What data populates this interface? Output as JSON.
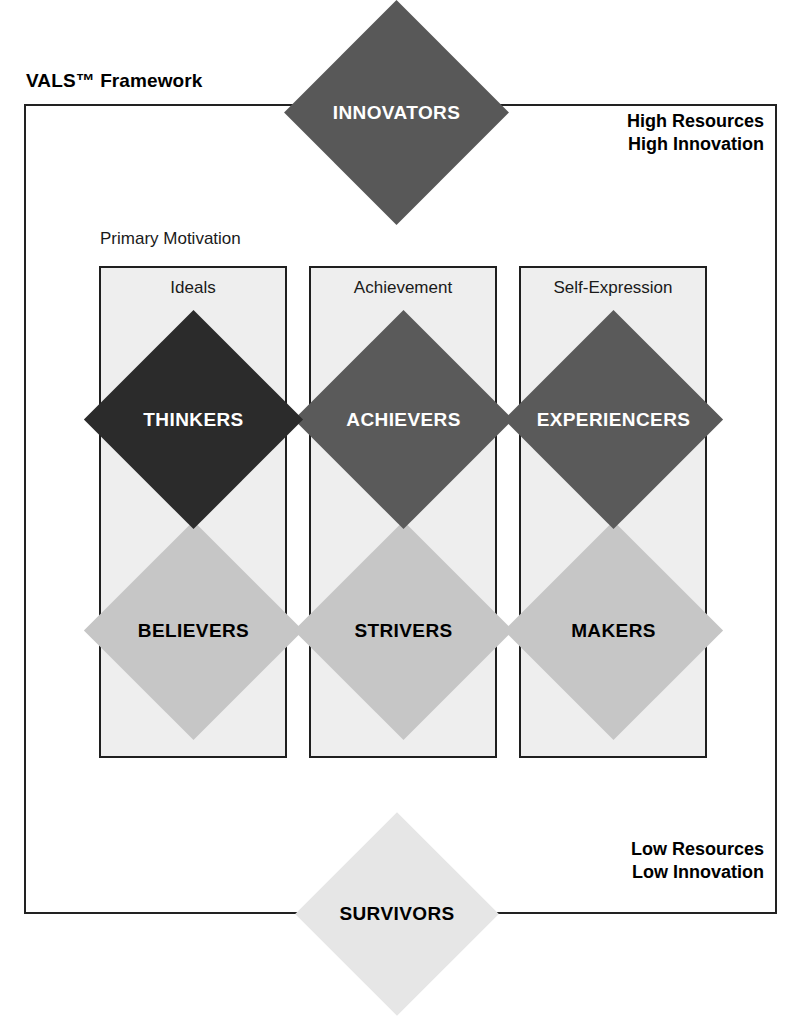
{
  "diagram": {
    "title": "VALS™ Framework",
    "primary_motivation_label": "Primary Motivation",
    "top_corner": {
      "line1": "High Resources",
      "line2": "High Innovation"
    },
    "bottom_corner": {
      "line1": "Low Resources",
      "line2": "Low Innovation"
    },
    "columns": [
      {
        "header": "Ideals"
      },
      {
        "header": "Achievement"
      },
      {
        "header": "Self-Expression"
      }
    ],
    "segments": {
      "innovators": {
        "label": "INNOVATORS",
        "fill": "#585858",
        "text_color": "#ffffff"
      },
      "thinkers": {
        "label": "THINKERS",
        "fill": "#2b2b2b",
        "text_color": "#ffffff"
      },
      "achievers": {
        "label": "ACHIEVERS",
        "fill": "#5a5a5a",
        "text_color": "#ffffff"
      },
      "experiencers": {
        "label": "EXPERIENCERS",
        "fill": "#5a5a5a",
        "text_color": "#ffffff"
      },
      "believers": {
        "label": "BELIEVERS",
        "fill": "#c6c6c6",
        "text_color": "#000000"
      },
      "strivers": {
        "label": "STRIVERS",
        "fill": "#c6c6c6",
        "text_color": "#000000"
      },
      "makers": {
        "label": "MAKERS",
        "fill": "#c6c6c6",
        "text_color": "#000000"
      },
      "survivors": {
        "label": "SURVIVORS",
        "fill": "#e6e6e6",
        "text_color": "#000000"
      }
    }
  },
  "chart_data": {
    "type": "diagram",
    "title": "VALS™ Framework",
    "axes": {
      "vertical": {
        "name": "Resources / Innovation",
        "high_label": "High Resources\nHigh Innovation",
        "low_label": "Low Resources\nLow Innovation"
      },
      "horizontal": {
        "name": "Primary Motivation",
        "categories": [
          "Ideals",
          "Achievement",
          "Self-Expression"
        ]
      }
    },
    "segments": [
      {
        "name": "INNOVATORS",
        "motivation": null,
        "resources": "High",
        "tier": "top",
        "fill": "#585858"
      },
      {
        "name": "THINKERS",
        "motivation": "Ideals",
        "resources": "Higher",
        "tier": "upper-middle",
        "fill": "#2b2b2b"
      },
      {
        "name": "ACHIEVERS",
        "motivation": "Achievement",
        "resources": "Higher",
        "tier": "upper-middle",
        "fill": "#5a5a5a"
      },
      {
        "name": "EXPERIENCERS",
        "motivation": "Self-Expression",
        "resources": "Higher",
        "tier": "upper-middle",
        "fill": "#5a5a5a"
      },
      {
        "name": "BELIEVERS",
        "motivation": "Ideals",
        "resources": "Lower",
        "tier": "lower-middle",
        "fill": "#c6c6c6"
      },
      {
        "name": "STRIVERS",
        "motivation": "Achievement",
        "resources": "Lower",
        "tier": "lower-middle",
        "fill": "#c6c6c6"
      },
      {
        "name": "MAKERS",
        "motivation": "Self-Expression",
        "resources": "Lower",
        "tier": "lower-middle",
        "fill": "#c6c6c6"
      },
      {
        "name": "SURVIVORS",
        "motivation": null,
        "resources": "Low",
        "tier": "bottom",
        "fill": "#e6e6e6"
      }
    ]
  }
}
